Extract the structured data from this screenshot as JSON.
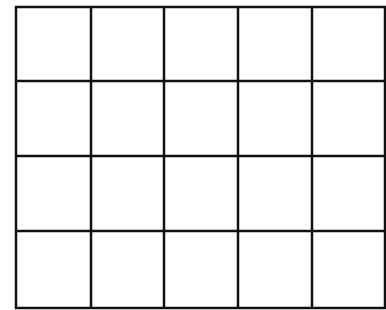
{
  "diagram": {
    "type": "grid",
    "rows": 4,
    "columns": 5,
    "line_color": "#111111",
    "background": "#ffffff",
    "line_width": 2.5,
    "column_edges": [
      16,
      91,
      164,
      238,
      312,
      385
    ],
    "row_edges": [
      7,
      81,
      156,
      231,
      308
    ],
    "cells": [
      [
        "",
        "",
        "",
        "",
        ""
      ],
      [
        "",
        "",
        "",
        "",
        ""
      ],
      [
        "",
        "",
        "",
        "",
        ""
      ],
      [
        "",
        "",
        "",
        "",
        ""
      ]
    ]
  }
}
